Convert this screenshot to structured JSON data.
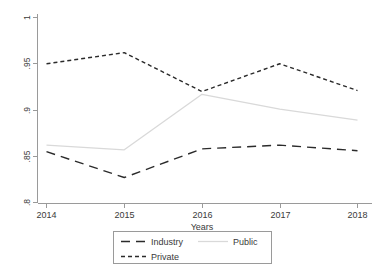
{
  "chart_data": {
    "type": "line",
    "title": "",
    "xlabel": "Years",
    "ylabel": "",
    "categories": [
      "2014",
      "2015",
      "2016",
      "2017",
      "2018"
    ],
    "x": [
      2014,
      2015,
      2016,
      2017,
      2018
    ],
    "xlim": [
      2014,
      2018
    ],
    "ylim": [
      0.8,
      1.0
    ],
    "grid": false,
    "legend_position": "bottom",
    "ytick_labels": [
      "1",
      ".95",
      ".9",
      ".85",
      ".8"
    ],
    "ytick_values": [
      1.0,
      0.95,
      0.9,
      0.85,
      0.8
    ],
    "series": [
      {
        "name": "Industry",
        "style": "long-dash",
        "color": "#2b2b2b",
        "values": [
          0.855,
          0.827,
          0.858,
          0.862,
          0.856
        ]
      },
      {
        "name": "Public",
        "style": "solid",
        "color": "#d9d9d9",
        "values": [
          0.862,
          0.857,
          0.917,
          0.901,
          0.889
        ]
      },
      {
        "name": "Private",
        "style": "short-dash",
        "color": "#2b2b2b",
        "values": [
          0.95,
          0.962,
          0.92,
          0.95,
          0.921
        ]
      }
    ]
  },
  "legend": {
    "entries": [
      {
        "label": "Industry"
      },
      {
        "label": "Public"
      },
      {
        "label": "Private"
      }
    ]
  },
  "axis": {
    "x_title": "Years"
  }
}
